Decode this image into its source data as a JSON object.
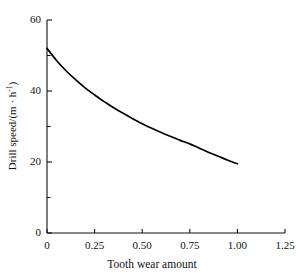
{
  "chart_data": {
    "type": "line",
    "title": "",
    "xlabel": "Tooth wear amount",
    "ylabel": "Drill speed/(m · h⁻¹)",
    "ylabel_parts": {
      "main": "Drill speed/(m · h",
      "exponent": "-1",
      "close": ")"
    },
    "xlim": [
      0,
      1.25
    ],
    "ylim": [
      0,
      60
    ],
    "grid": false,
    "legend": null,
    "x_ticks": [
      0,
      0.25,
      0.5,
      0.75,
      1.0,
      1.25
    ],
    "x_tick_labels": [
      "0",
      "0.25",
      "0.50",
      "0.75",
      "1.00",
      "1.25"
    ],
    "y_ticks": [
      0,
      10,
      20,
      30,
      40,
      50,
      60
    ],
    "y_tick_labels": [
      "0",
      "",
      "20",
      "",
      "40",
      "",
      "60"
    ],
    "y_major_labels": [
      "0",
      "20",
      "40",
      "60"
    ],
    "series": [
      {
        "name": "Drill speed vs tooth wear",
        "color": "#000000",
        "x": [
          0.0,
          0.05,
          0.1,
          0.15,
          0.2,
          0.25,
          0.3,
          0.35,
          0.4,
          0.45,
          0.5,
          0.55,
          0.6,
          0.65,
          0.7,
          0.75,
          0.8,
          0.85,
          0.9,
          0.95,
          1.0
        ],
        "y": [
          52.0,
          48.6,
          45.7,
          43.2,
          40.9,
          38.9,
          37.0,
          35.3,
          33.7,
          32.2,
          30.8,
          29.5,
          28.3,
          27.2,
          26.1,
          25.1,
          23.9,
          22.7,
          21.6,
          20.5,
          19.5
        ]
      }
    ]
  },
  "axes_geometry": {
    "x0": 47,
    "x1": 285,
    "y0": 233,
    "y1": 20
  }
}
